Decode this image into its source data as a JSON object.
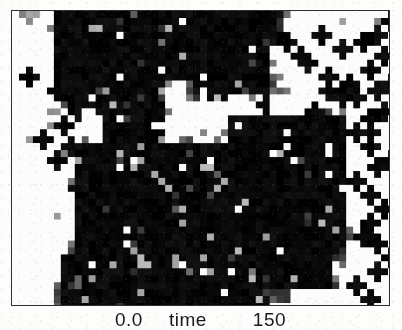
{
  "figure": {
    "title": "",
    "background_color": "#fdfdfc",
    "frame_color": "#2e2e2e",
    "plot_background": "#ffffff"
  },
  "axis": {
    "x_min_label": "0.0",
    "x_name_label": "time",
    "x_max_label": "150",
    "full_label": "0.0 time 150"
  },
  "chart_data": {
    "type": "scatter",
    "title": "",
    "xlabel": "time",
    "ylabel": "",
    "xlim": [
      0.0,
      150
    ],
    "ylim": [
      0,
      1
    ],
    "grid": false,
    "legend": null,
    "marker": "plus-cross",
    "marker_color": "#1a1a1a",
    "secondary_marker_color": "#7a7a7a",
    "cell_size_px": 7,
    "dense_regions": [
      {
        "name": "upper-band",
        "x_range": [
          8,
          95
        ],
        "y_range": [
          90,
          100
        ],
        "density": 0.95
      },
      {
        "name": "central-mass",
        "x_range": [
          10,
          100
        ],
        "y_range": [
          5,
          62
        ],
        "density": 0.97
      },
      {
        "name": "upper-right-spur",
        "x_range": [
          60,
          80
        ],
        "y_range": [
          62,
          90
        ],
        "density": 0.6
      }
    ],
    "sparse_markers_x": [
      4,
      7,
      9,
      12,
      15,
      18,
      88,
      91,
      94,
      96,
      97,
      99
    ],
    "sparse_markers_y": [
      55,
      62,
      70,
      78,
      82,
      88,
      30,
      44,
      58,
      66,
      74,
      86
    ]
  }
}
